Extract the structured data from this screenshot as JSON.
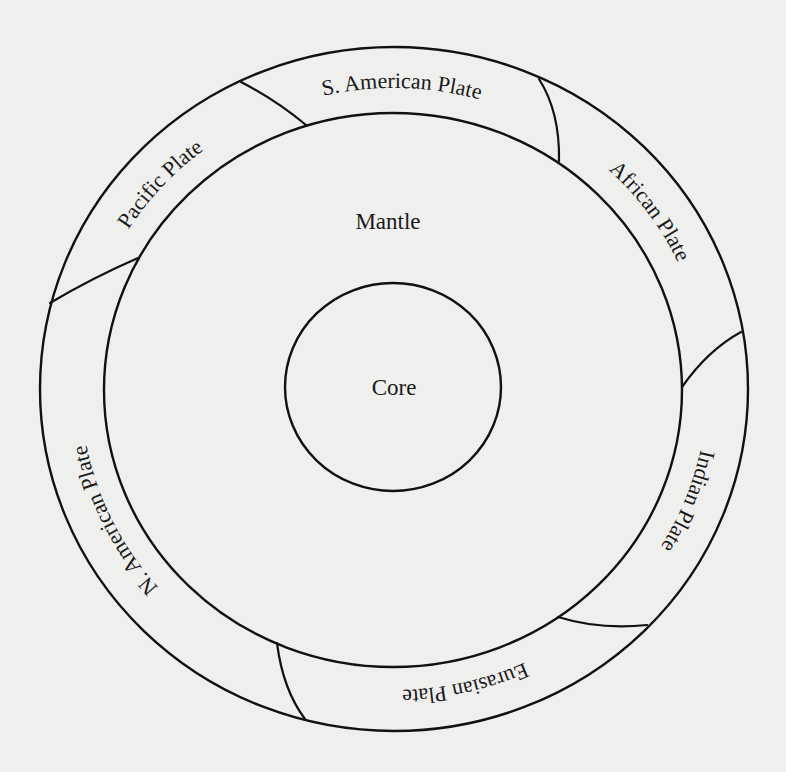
{
  "diagram": {
    "colors": {
      "background": "#efefee",
      "stroke": "#111111",
      "text": "#1a1a1a"
    },
    "layers": {
      "core": "Core",
      "mantle": "Mantle"
    },
    "plates": [
      {
        "id": "indian",
        "label": "Indian Plate",
        "position_pct": "5.9%"
      },
      {
        "id": "eurasian",
        "label": "Eurasian Plate",
        "position_pct": "21.3%"
      },
      {
        "id": "n-american",
        "label": "N. American Plate",
        "position_pct": "42.9%"
      },
      {
        "id": "pacific",
        "label": "Pacific Plate",
        "position_pct": "61.6%"
      },
      {
        "id": "s-american",
        "label": "S. American Plate",
        "position_pct": "75.4%"
      },
      {
        "id": "african",
        "label": "African Plate",
        "position_pct": "90.2%"
      }
    ]
  }
}
